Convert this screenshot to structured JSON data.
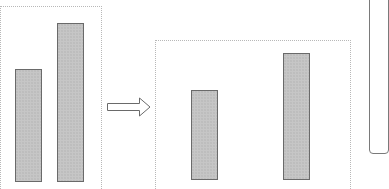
{
  "diagram": {
    "colors": {
      "bar_fill": "#c6c6c6",
      "bar_border": "#6a6a6a",
      "frame_border": "#b8b8b8",
      "arrow_stroke": "#6a6a6a"
    },
    "left_panel": {
      "bars": [
        {
          "name": "bar-1",
          "x": 15,
          "top": 69,
          "width": 27,
          "height": 113
        },
        {
          "name": "bar-2",
          "x": 57,
          "top": 23,
          "width": 27,
          "height": 159
        }
      ]
    },
    "arrow": {
      "direction": "right",
      "style": "outline"
    },
    "right_panel": {
      "bars": [
        {
          "name": "bar-1",
          "x": 191,
          "top": 90,
          "width": 27,
          "height": 90
        },
        {
          "name": "bar-2",
          "x": 283,
          "top": 53,
          "width": 27,
          "height": 127
        }
      ]
    }
  }
}
